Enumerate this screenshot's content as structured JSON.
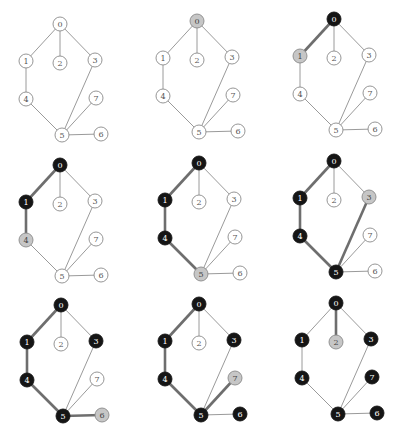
{
  "colors": {
    "unvisited_fill": "#ffffff",
    "unvisited_stroke": "#8a8a8a",
    "unvisited_text": "#555555",
    "frontier_fill": "#c6c6c6",
    "frontier_stroke": "#8a8a8a",
    "frontier_text": "#444444",
    "visited_fill": "#151515",
    "visited_stroke": "#151515",
    "visited_text": "#ffffff"
  },
  "graph": {
    "nodes": [
      {
        "id": "0",
        "dx": 0,
        "dy": 0
      },
      {
        "id": "1",
        "dx": -34,
        "dy": 37
      },
      {
        "id": "2",
        "dx": 0,
        "dy": 39
      },
      {
        "id": "3",
        "dx": 35,
        "dy": 36
      },
      {
        "id": "4",
        "dx": -34,
        "dy": 75
      },
      {
        "id": "5",
        "dx": 2,
        "dy": 111
      },
      {
        "id": "6",
        "dx": 41,
        "dy": 110
      },
      {
        "id": "7",
        "dx": 36,
        "dy": 74
      }
    ],
    "edges": [
      [
        "0",
        "1"
      ],
      [
        "0",
        "2"
      ],
      [
        "0",
        "3"
      ],
      [
        "1",
        "4"
      ],
      [
        "4",
        "5"
      ],
      [
        "3",
        "5"
      ],
      [
        "5",
        "7"
      ],
      [
        "5",
        "6"
      ]
    ],
    "node_radius": 7
  },
  "panels": [
    {
      "step": 1,
      "ox": 60,
      "oy": 24,
      "visited": [],
      "frontier": [],
      "path_edges": []
    },
    {
      "step": 2,
      "ox": 197,
      "oy": 21,
      "visited": [],
      "frontier": [
        "0"
      ],
      "path_edges": []
    },
    {
      "step": 3,
      "ox": 334,
      "oy": 19,
      "visited": [
        "0"
      ],
      "frontier": [
        "1"
      ],
      "path_edges": [
        [
          "0",
          "1"
        ]
      ]
    },
    {
      "step": 4,
      "ox": 60,
      "oy": 165,
      "visited": [
        "0",
        "1"
      ],
      "frontier": [
        "4"
      ],
      "path_edges": [
        [
          "0",
          "1"
        ],
        [
          "1",
          "4"
        ]
      ]
    },
    {
      "step": 5,
      "ox": 199,
      "oy": 163,
      "visited": [
        "0",
        "1",
        "4"
      ],
      "frontier": [
        "5"
      ],
      "path_edges": [
        [
          "0",
          "1"
        ],
        [
          "1",
          "4"
        ],
        [
          "4",
          "5"
        ]
      ]
    },
    {
      "step": 6,
      "ox": 334,
      "oy": 161,
      "visited": [
        "0",
        "1",
        "4",
        "5"
      ],
      "frontier": [
        "3"
      ],
      "path_edges": [
        [
          "0",
          "1"
        ],
        [
          "1",
          "4"
        ],
        [
          "4",
          "5"
        ],
        [
          "3",
          "5"
        ]
      ]
    },
    {
      "step": 7,
      "ox": 61,
      "oy": 305,
      "visited": [
        "0",
        "1",
        "3",
        "4",
        "5"
      ],
      "frontier": [
        "6"
      ],
      "path_edges": [
        [
          "0",
          "1"
        ],
        [
          "1",
          "4"
        ],
        [
          "4",
          "5"
        ],
        [
          "5",
          "6"
        ]
      ]
    },
    {
      "step": 8,
      "ox": 199,
      "oy": 304,
      "visited": [
        "0",
        "1",
        "3",
        "4",
        "5",
        "6"
      ],
      "frontier": [
        "7"
      ],
      "path_edges": [
        [
          "0",
          "1"
        ],
        [
          "1",
          "4"
        ],
        [
          "4",
          "5"
        ],
        [
          "5",
          "7"
        ]
      ]
    },
    {
      "step": 9,
      "ox": 336,
      "oy": 303,
      "visited": [
        "0",
        "1",
        "3",
        "4",
        "5",
        "6",
        "7"
      ],
      "frontier": [
        "2"
      ],
      "path_edges": [
        [
          "0",
          "2"
        ]
      ]
    }
  ]
}
